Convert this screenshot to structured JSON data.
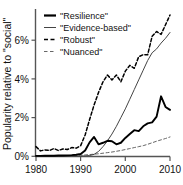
{
  "chart_data": {
    "type": "line",
    "title": "",
    "xlabel": "",
    "ylabel": "Popularity relative to \"social\"",
    "xlim": [
      1980,
      2010
    ],
    "ylim": [
      0,
      7.6
    ],
    "grid": false,
    "legend_position": "top-left",
    "xticks": [
      1980,
      1990,
      2000,
      2010
    ],
    "xtick_labels": [
      "1980",
      "1990",
      "2000",
      "2010"
    ],
    "yticks": [
      0,
      2,
      4,
      6
    ],
    "ytick_labels": [
      "0%",
      "2%",
      "4%",
      "6%"
    ],
    "series": [
      {
        "name": "\"Resilience\"",
        "style": "solid-thick",
        "color": "#000000",
        "x": [
          1980,
          1981,
          1982,
          1983,
          1984,
          1985,
          1986,
          1987,
          1988,
          1989,
          1990,
          1991,
          1992,
          1993,
          1994,
          1995,
          1996,
          1997,
          1998,
          1999,
          2000,
          2001,
          2002,
          2003,
          2004,
          2005,
          2006,
          2007,
          2008,
          2009,
          2010
        ],
        "values": [
          0.02,
          0.02,
          0.03,
          0.03,
          0.03,
          0.04,
          0.04,
          0.05,
          0.06,
          0.08,
          0.12,
          0.3,
          0.72,
          1.0,
          0.62,
          0.7,
          0.8,
          0.78,
          0.62,
          0.7,
          0.95,
          1.15,
          1.35,
          1.3,
          1.55,
          1.7,
          1.75,
          2.05,
          3.1,
          2.55,
          2.4
        ]
      },
      {
        "name": "\"Evidence-based\"",
        "style": "solid-thin",
        "color": "#444444",
        "x": [
          1980,
          1981,
          1982,
          1983,
          1984,
          1985,
          1986,
          1987,
          1988,
          1989,
          1990,
          1991,
          1992,
          1993,
          1994,
          1995,
          1996,
          1997,
          1998,
          1999,
          2000,
          2001,
          2002,
          2003,
          2004,
          2005,
          2006,
          2007,
          2008,
          2009,
          2010
        ],
        "values": [
          0.0,
          0.0,
          0.0,
          0.0,
          0.0,
          0.0,
          0.0,
          0.0,
          0.0,
          0.0,
          0.01,
          0.02,
          0.04,
          0.1,
          0.25,
          0.5,
          0.8,
          1.15,
          1.55,
          2.0,
          2.45,
          2.95,
          3.45,
          3.95,
          4.45,
          4.95,
          5.35,
          5.55,
          5.85,
          6.1,
          6.4
        ]
      },
      {
        "name": "\"Robust\"",
        "style": "dashed",
        "color": "#000000",
        "x": [
          1980,
          1981,
          1982,
          1983,
          1984,
          1985,
          1986,
          1987,
          1988,
          1989,
          1990,
          1991,
          1992,
          1993,
          1994,
          1995,
          1996,
          1997,
          1998,
          1999,
          2000,
          2001,
          2002,
          2003,
          2004,
          2005,
          2006,
          2007,
          2008,
          2009,
          2010
        ],
        "values": [
          0.5,
          0.28,
          0.33,
          0.3,
          0.4,
          0.3,
          0.38,
          0.35,
          0.45,
          0.42,
          0.55,
          1.1,
          1.9,
          2.65,
          3.3,
          3.85,
          4.2,
          3.95,
          4.2,
          3.85,
          4.4,
          4.7,
          4.55,
          5.15,
          5.25,
          5.25,
          6.2,
          6.45,
          6.3,
          6.8,
          7.3
        ]
      },
      {
        "name": "\"Nuanced\"",
        "style": "dashed-fine",
        "color": "#666666",
        "x": [
          1980,
          1981,
          1982,
          1983,
          1984,
          1985,
          1986,
          1987,
          1988,
          1989,
          1990,
          1991,
          1992,
          1993,
          1994,
          1995,
          1996,
          1997,
          1998,
          1999,
          2000,
          2001,
          2002,
          2003,
          2004,
          2005,
          2006,
          2007,
          2008,
          2009,
          2010
        ],
        "values": [
          0.02,
          0.02,
          0.02,
          0.03,
          0.03,
          0.03,
          0.04,
          0.04,
          0.05,
          0.05,
          0.06,
          0.07,
          0.09,
          0.11,
          0.13,
          0.16,
          0.19,
          0.22,
          0.26,
          0.3,
          0.35,
          0.4,
          0.45,
          0.5,
          0.55,
          0.62,
          0.7,
          0.78,
          0.85,
          0.92,
          1.0
        ]
      }
    ]
  },
  "legend": {
    "items": [
      {
        "label": "\"Resilience\""
      },
      {
        "label": "\"Evidence-based\""
      },
      {
        "label": "\"Robust\""
      },
      {
        "label": "\"Nuanced\""
      }
    ]
  },
  "axes": {
    "y_label": "Popularity relative to \"social\"",
    "y_tick_0": "0%",
    "y_tick_1": "2%",
    "y_tick_2": "4%",
    "y_tick_3": "6%",
    "x_tick_0": "1980",
    "x_tick_1": "1990",
    "x_tick_2": "2000",
    "x_tick_3": "2010"
  },
  "colors": {
    "background": "#ffffff",
    "axis": "#555555",
    "resilience": "#000000",
    "evidence_based": "#444444",
    "robust": "#000000",
    "nuanced": "#666666"
  }
}
